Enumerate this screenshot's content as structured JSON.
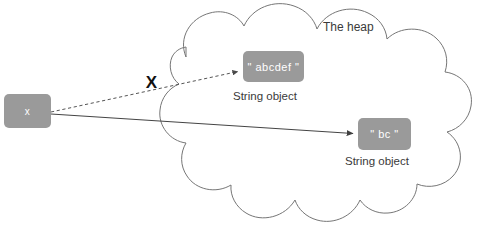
{
  "diagram": {
    "title_label": "The heap",
    "cross_marker": "X",
    "variable_box": {
      "label": "x",
      "fill": "#9a9a9a",
      "text_color": "#ffffff"
    },
    "objects": [
      {
        "id": "string-object-abcdef",
        "value": "\" abcdef \"",
        "caption": "String object",
        "fill": "#9a9a9a",
        "text_color": "#ffffff"
      },
      {
        "id": "string-object-bc",
        "value": "\" bc \"",
        "caption": "String object",
        "fill": "#9a9a9a",
        "text_color": "#ffffff"
      }
    ],
    "arrows": [
      {
        "id": "broken-reference-arrow",
        "style": "dashed",
        "from": "variable-box",
        "to": "string-object-abcdef",
        "crossed_out": true,
        "color": "#555555"
      },
      {
        "id": "active-reference-arrow",
        "style": "solid",
        "from": "variable-box",
        "to": "string-object-bc",
        "crossed_out": false,
        "color": "#444444"
      }
    ],
    "cloud": {
      "stroke": "#767676",
      "fill": "#ffffff"
    },
    "background": "#ffffff"
  }
}
